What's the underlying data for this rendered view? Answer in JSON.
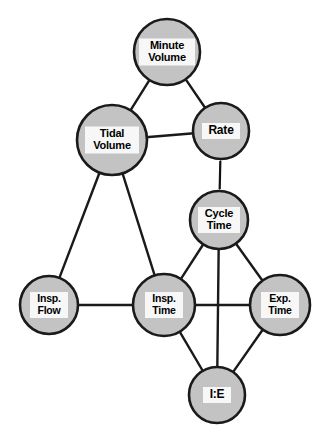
{
  "diagram": {
    "background_color": "#ffffff",
    "node_fill_color": "#c3c3c3",
    "node_stroke_color": "#1a1a1a",
    "label_box_color": "#f7f7f7",
    "edge_color": "#1a1a1a",
    "nodes": [
      {
        "id": "minute-volume",
        "label": "Minute\nVolume",
        "cx": 167,
        "cy": 52,
        "r": 33,
        "label_w": 56,
        "label_h": 27,
        "style": "two-line"
      },
      {
        "id": "tidal-volume",
        "label": "Tidal\nVolume",
        "cx": 112,
        "cy": 140,
        "r": 35,
        "label_w": 54,
        "label_h": 27,
        "style": "two-line"
      },
      {
        "id": "rate",
        "label": "Rate",
        "cx": 221,
        "cy": 131,
        "r": 28,
        "label_w": 38,
        "label_h": 16,
        "style": "one-line"
      },
      {
        "id": "cycle-time",
        "label": "Cycle\nTime",
        "cx": 219,
        "cy": 220,
        "r": 29,
        "label_w": 42,
        "label_h": 26,
        "style": "two-line"
      },
      {
        "id": "insp-flow",
        "label": "Insp.\nFlow",
        "cx": 49,
        "cy": 305,
        "r": 29,
        "label_w": 38,
        "label_h": 26,
        "style": "small-two"
      },
      {
        "id": "insp-time",
        "label": "Insp.\nTime",
        "cx": 164,
        "cy": 305,
        "r": 31,
        "label_w": 38,
        "label_h": 26,
        "style": "small-two"
      },
      {
        "id": "exp-time",
        "label": "Exp.\nTime",
        "cx": 280,
        "cy": 305,
        "r": 30,
        "label_w": 38,
        "label_h": 26,
        "style": "small-two"
      },
      {
        "id": "i-e",
        "label": "I:E",
        "cx": 217,
        "cy": 395,
        "r": 28,
        "label_w": 28,
        "label_h": 16,
        "style": "one-line"
      }
    ],
    "edges": [
      {
        "from": "minute-volume",
        "to": "tidal-volume",
        "kind": "plain"
      },
      {
        "from": "minute-volume",
        "to": "rate",
        "kind": "plain"
      },
      {
        "from": "tidal-volume",
        "to": "rate",
        "kind": "plain"
      },
      {
        "from": "tidal-volume",
        "to": "insp-flow",
        "kind": "plain"
      },
      {
        "from": "tidal-volume",
        "to": "insp-time",
        "kind": "plain"
      },
      {
        "from": "rate",
        "to": "cycle-time",
        "kind": "double-arrow"
      },
      {
        "from": "cycle-time",
        "to": "insp-time",
        "kind": "plain"
      },
      {
        "from": "cycle-time",
        "to": "exp-time",
        "kind": "plain"
      },
      {
        "from": "cycle-time",
        "to": "i-e",
        "kind": "plain"
      },
      {
        "from": "insp-flow",
        "to": "insp-time",
        "kind": "plain"
      },
      {
        "from": "insp-time",
        "to": "exp-time",
        "kind": "plain"
      },
      {
        "from": "insp-time",
        "to": "i-e",
        "kind": "plain"
      },
      {
        "from": "exp-time",
        "to": "i-e",
        "kind": "plain"
      }
    ]
  }
}
